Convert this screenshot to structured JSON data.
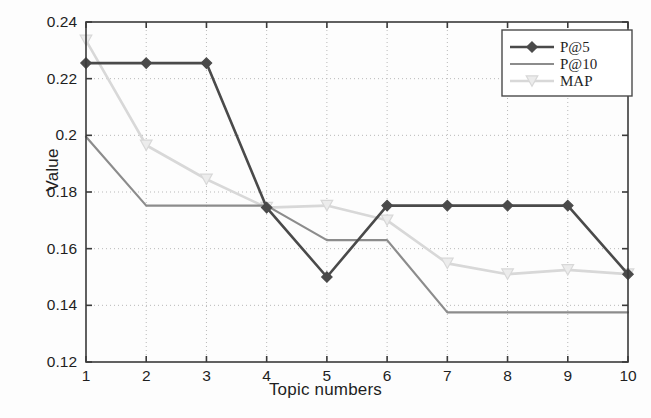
{
  "chart_data": {
    "type": "line",
    "title": "",
    "xlabel": "Topic numbers",
    "ylabel": "Value",
    "x": [
      1,
      2,
      3,
      4,
      5,
      6,
      7,
      8,
      9,
      10
    ],
    "xticklabels": [
      "1",
      "2",
      "3",
      "4",
      "5",
      "6",
      "7",
      "8",
      "9",
      "10"
    ],
    "yticklabels": [
      "0.12",
      "0.14",
      "0.16",
      "0.18",
      "0.2",
      "0.22",
      "0.24"
    ],
    "yticks": [
      0.12,
      0.14,
      0.16,
      0.18,
      0.2,
      0.22,
      0.24
    ],
    "xlim": [
      1,
      10
    ],
    "ylim": [
      0.12,
      0.24
    ],
    "grid": true,
    "grid_style": "dotted",
    "legend_position": "top-right",
    "series": [
      {
        "name": "P@5",
        "color": "#4a4a4a",
        "marker": "diamond",
        "values": [
          0.2255,
          0.2255,
          0.2255,
          0.1745,
          0.15,
          0.1752,
          0.1752,
          0.1752,
          0.1752,
          0.151
        ]
      },
      {
        "name": "P@10",
        "color": "#8c8c8c",
        "marker": "none",
        "values": [
          0.1995,
          0.1752,
          0.1752,
          0.1752,
          0.163,
          0.163,
          0.1375,
          0.1375,
          0.1375,
          0.1375
        ]
      },
      {
        "name": "MAP",
        "color": "#d8d8d8",
        "marker": "triangle-down",
        "values": [
          0.2335,
          0.1965,
          0.1845,
          0.1745,
          0.1752,
          0.17,
          0.1548,
          0.151,
          0.1525,
          0.151
        ]
      }
    ]
  },
  "legend": {
    "entries": [
      {
        "label": "P@5"
      },
      {
        "label": "P@10"
      },
      {
        "label": "MAP"
      }
    ]
  }
}
